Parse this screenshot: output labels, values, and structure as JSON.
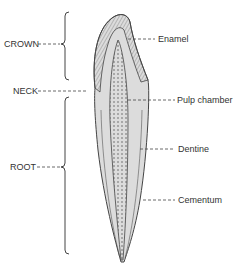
{
  "diagram": {
    "left_labels": [
      {
        "id": "crown",
        "text": "CROWN"
      },
      {
        "id": "neck",
        "text": "NECK"
      },
      {
        "id": "root",
        "text": "ROOT"
      }
    ],
    "right_labels": [
      {
        "id": "enamel",
        "text": "Enamel"
      },
      {
        "id": "pulp_chamber",
        "text": "Pulp chamber"
      },
      {
        "id": "dentine",
        "text": "Dentine"
      },
      {
        "id": "cementum",
        "text": "Cementum"
      }
    ],
    "colors": {
      "line": "#444444",
      "text": "#333333",
      "background": "#ffffff"
    }
  }
}
